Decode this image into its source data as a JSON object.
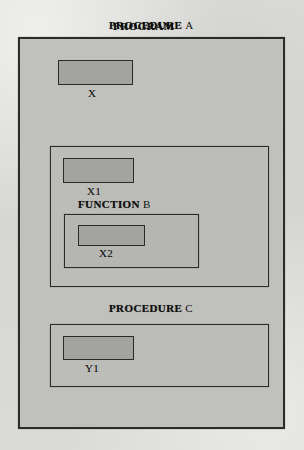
{
  "diagram": {
    "type": "nested-scope-diagram",
    "page_background": "#d9d9d6",
    "scope_fill": "#bcbcb9",
    "variable_fill": "#a3a3a0",
    "border_color": "#2b2b2b",
    "program": {
      "keyword": "PROGRAM",
      "identifier": "",
      "title": "PROGRAM",
      "variables": [
        {
          "name": "X"
        }
      ],
      "children": [
        {
          "keyword": "PROCEDURE",
          "identifier": "A",
          "variables": [
            {
              "name": "X1"
            }
          ],
          "children": [
            {
              "keyword": "FUNCTION",
              "identifier": "B",
              "variables": [
                {
                  "name": "X2"
                }
              ],
              "children": []
            }
          ]
        },
        {
          "keyword": "PROCEDURE",
          "identifier": "C",
          "variables": [
            {
              "name": "Y1"
            }
          ],
          "children": []
        }
      ]
    }
  }
}
